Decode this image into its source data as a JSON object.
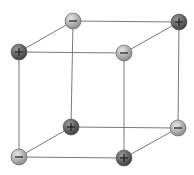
{
  "diagram": {
    "colors": {
      "edge": "#7a7a7a",
      "positive_fill_light": "#9a9a9a",
      "positive_fill_dark": "#3c3c3c",
      "negative_fill_light": "#e6e6e6",
      "negative_fill_dark": "#8a8a8a",
      "symbol": "#1e1e1e"
    },
    "ions": [
      {
        "id": "back-top-left",
        "charge": "negative",
        "symbol": "−",
        "x": 73,
        "y": 21
      },
      {
        "id": "back-top-right",
        "charge": "positive",
        "symbol": "+",
        "x": 179,
        "y": 22
      },
      {
        "id": "front-top-left",
        "charge": "positive",
        "symbol": "+",
        "x": 19,
        "y": 52
      },
      {
        "id": "front-top-right",
        "charge": "negative",
        "symbol": "−",
        "x": 124,
        "y": 53
      },
      {
        "id": "back-bottom-left",
        "charge": "positive",
        "symbol": "+",
        "x": 71,
        "y": 127
      },
      {
        "id": "back-bottom-right",
        "charge": "negative",
        "symbol": "−",
        "x": 178,
        "y": 128
      },
      {
        "id": "front-bottom-left",
        "charge": "negative",
        "symbol": "−",
        "x": 19,
        "y": 157
      },
      {
        "id": "front-bottom-right",
        "charge": "positive",
        "symbol": "+",
        "x": 124,
        "y": 158
      }
    ],
    "edges": [
      [
        "back-top-left",
        "back-top-right"
      ],
      [
        "front-top-left",
        "front-top-right"
      ],
      [
        "back-top-left",
        "front-top-left"
      ],
      [
        "back-top-right",
        "front-top-right"
      ],
      [
        "back-bottom-left",
        "back-bottom-right"
      ],
      [
        "front-bottom-left",
        "front-bottom-right"
      ],
      [
        "back-bottom-left",
        "front-bottom-left"
      ],
      [
        "back-bottom-right",
        "front-bottom-right"
      ],
      [
        "back-top-left",
        "back-bottom-left"
      ],
      [
        "back-top-right",
        "back-bottom-right"
      ],
      [
        "front-top-left",
        "front-bottom-left"
      ],
      [
        "front-top-right",
        "front-bottom-right"
      ]
    ]
  }
}
